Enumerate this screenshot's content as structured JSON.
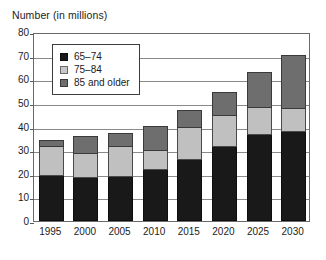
{
  "chart_data": {
    "type": "bar",
    "subtype": "stacked-vertical",
    "title": "Number (in millions)",
    "xlabel": "",
    "ylabel": "Number (in millions)",
    "categories": [
      "1995",
      "2000",
      "2005",
      "2010",
      "2015",
      "2020",
      "2025",
      "2030"
    ],
    "series": [
      {
        "name": "65–74",
        "color": "#191919",
        "values": [
          19,
          18,
          18.5,
          21.5,
          26,
          31.5,
          36.5,
          37.5
        ]
      },
      {
        "name": "75–84",
        "color": "#c0c0c0",
        "values": [
          12.5,
          10.5,
          13,
          8,
          13.5,
          13,
          11.5,
          10
        ]
      },
      {
        "name": "85 and older",
        "color": "#6e6e6e",
        "values": [
          2.5,
          7,
          5.5,
          10.5,
          7,
          9.5,
          14.5,
          22.5
        ]
      }
    ],
    "totals": [
      34,
      35.5,
      37,
      40,
      46.5,
      54,
      62.5,
      70
    ],
    "ylim": [
      0,
      80
    ],
    "ytick_labels": [
      "0",
      "10",
      "20",
      "30",
      "40",
      "50",
      "60",
      "70",
      "80"
    ],
    "ytick_values": [
      0,
      10,
      20,
      30,
      40,
      50,
      60,
      70,
      80
    ],
    "grid": true,
    "legend_position": "upper-left-inside"
  },
  "legend": {
    "items": [
      {
        "label": "65–74",
        "swatch": "black-swatch-icon"
      },
      {
        "label": "75–84",
        "swatch": "light-gray-swatch-icon"
      },
      {
        "label": "85 and older",
        "swatch": "dark-gray-swatch-icon"
      }
    ]
  },
  "caption": {
    "text": ""
  }
}
